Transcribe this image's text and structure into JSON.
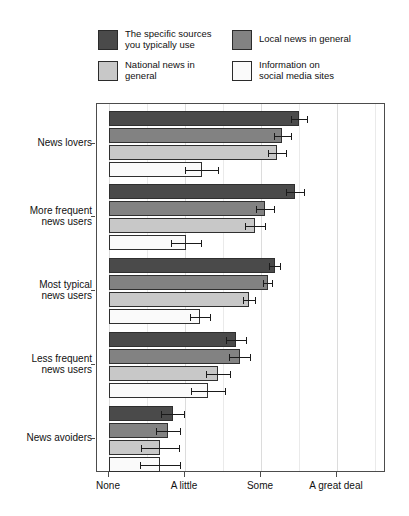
{
  "legend": {
    "items": [
      {
        "label": "The specific sources\nyou typically use",
        "color": "#4a4a4a",
        "key": "specific_sources"
      },
      {
        "label": "Local news in general",
        "color": "#828282",
        "key": "local_news"
      },
      {
        "label": "National news in general",
        "color": "#c8c8c8",
        "key": "national_news"
      },
      {
        "label": "Information on\nsocial media sites",
        "color": "#fafafa",
        "key": "social_media"
      }
    ]
  },
  "chart_data": {
    "type": "bar",
    "orientation": "horizontal",
    "title": "",
    "xlabel": "",
    "ylabel": "",
    "grid": true,
    "legend_position": "top",
    "xlim": [
      0,
      3
    ],
    "xticks": [
      0,
      1,
      2,
      3
    ],
    "xtick_labels": [
      "None",
      "A little",
      "Some",
      "A great deal"
    ],
    "categories": [
      "News lovers",
      "More frequent\nnews users",
      "Most typical\nnews users",
      "Less frequent\nnews users",
      "News avoiders"
    ],
    "series": [
      {
        "name": "The specific sources you typically use",
        "color": "#4a4a4a",
        "values": [
          2.5,
          2.45,
          2.18,
          1.67,
          0.84
        ],
        "errors": [
          0.11,
          0.12,
          0.07,
          0.13,
          0.15
        ]
      },
      {
        "name": "Local news in general",
        "color": "#828282",
        "values": [
          2.28,
          2.05,
          2.09,
          1.72,
          0.78
        ],
        "errors": [
          0.11,
          0.12,
          0.06,
          0.14,
          0.16
        ]
      },
      {
        "name": "National news in general",
        "color": "#c8c8c8",
        "values": [
          2.21,
          1.92,
          1.84,
          1.43,
          0.67
        ],
        "errors": [
          0.12,
          0.13,
          0.08,
          0.16,
          0.25
        ]
      },
      {
        "name": "Information on social media sites",
        "color": "#fafafa",
        "values": [
          1.22,
          1.01,
          1.2,
          1.3,
          0.67
        ],
        "errors": [
          0.22,
          0.2,
          0.13,
          0.22,
          0.26
        ]
      }
    ]
  }
}
